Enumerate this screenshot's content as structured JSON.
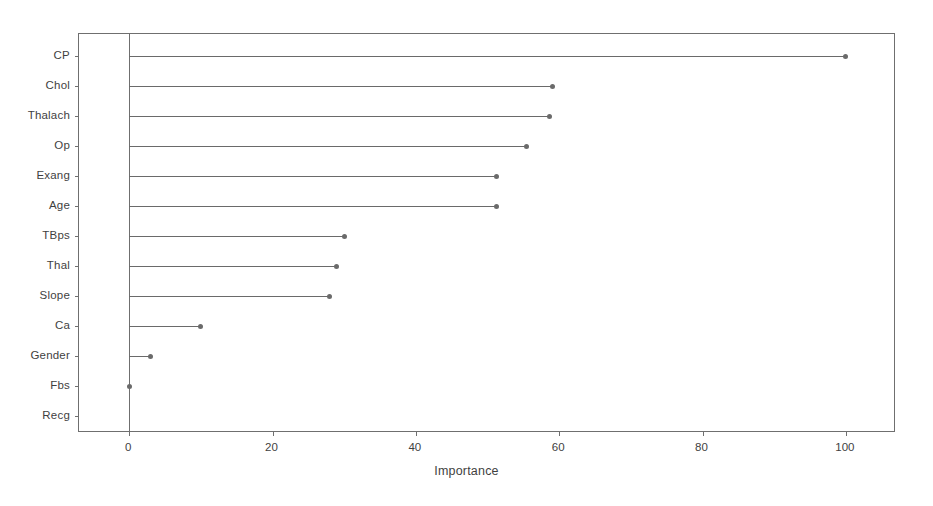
{
  "chart_data": {
    "type": "bar",
    "variant": "horizontal-lollipop",
    "title": "",
    "subtitle": "",
    "xlabel": "Importance",
    "ylabel": "",
    "categories": [
      "CP",
      "Chol",
      "Thalach",
      "Op",
      "Exang",
      "Age",
      "TBps",
      "Thal",
      "Slope",
      "Ca",
      "Gender",
      "Fbs",
      "Recg"
    ],
    "values": [
      100,
      59,
      58.7,
      55.5,
      51.3,
      51.2,
      30,
      28.9,
      28,
      10,
      3,
      0,
      0
    ],
    "series": [
      {
        "name": "Importance",
        "values": [
          100,
          59,
          58.7,
          55.5,
          51.3,
          51.2,
          30,
          28.9,
          28,
          10,
          3,
          0,
          0
        ]
      }
    ],
    "xlim": [
      -7,
      107
    ],
    "ylim": [
      0,
      13
    ],
    "xticks": [
      0,
      20,
      40,
      60,
      80,
      100
    ],
    "xtick_labels": [
      "0",
      "20",
      "40",
      "60",
      "80",
      "100"
    ],
    "grid": false,
    "legend": false,
    "legend_position": "none",
    "marker": "circle",
    "marker_color": "#6a6a6a",
    "line_color": "#6a6a6a",
    "axis_color": "#6f6f6f",
    "background_color": "#ffffff",
    "text_color": "#3f3f3f",
    "baseline_value": 0,
    "points": [
      {
        "label": "CP",
        "value": 100
      },
      {
        "label": "Chol",
        "value": 59
      },
      {
        "label": "Thalach",
        "value": 58.7
      },
      {
        "label": "Op",
        "value": 55.5
      },
      {
        "label": "Exang",
        "value": 51.3
      },
      {
        "label": "Age",
        "value": 51.2
      },
      {
        "label": "TBps",
        "value": 30
      },
      {
        "label": "Thal",
        "value": 28.9
      },
      {
        "label": "Slope",
        "value": 28
      },
      {
        "label": "Ca",
        "value": 10
      },
      {
        "label": "Gender",
        "value": 3
      },
      {
        "label": "Fbs",
        "value": 0
      },
      {
        "label": "Recg",
        "value": 0
      }
    ]
  }
}
